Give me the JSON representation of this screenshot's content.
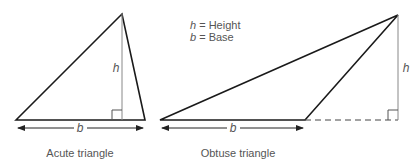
{
  "legend": {
    "line1_var": "h",
    "line1_text": " = Height",
    "line2_var": "b",
    "line2_text": " = Base"
  },
  "acute": {
    "height_label": "h",
    "base_label": "b",
    "caption": "Acute triangle"
  },
  "obtuse": {
    "height_label": "h",
    "base_label": "b",
    "caption": "Obtuse triangle"
  },
  "colors": {
    "stroke": "#1a1a1a",
    "height_line": "#888888",
    "text": "#555555"
  }
}
